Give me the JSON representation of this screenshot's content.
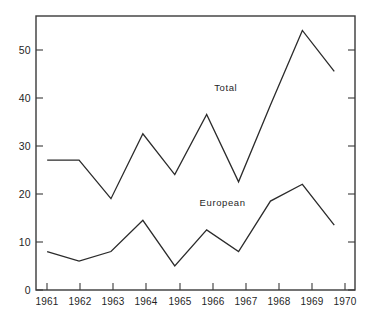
{
  "chart_data": {
    "type": "line",
    "title": "",
    "subtitle": "",
    "xlabel": "",
    "ylabel": "",
    "categories": [
      "1961",
      "1962",
      "1963",
      "1964",
      "1965",
      "1966",
      "1967",
      "1968",
      "1969",
      "1970"
    ],
    "x": [
      1961,
      1962,
      1963,
      1964,
      1965,
      1966,
      1967,
      1968,
      1969,
      1970
    ],
    "series": [
      {
        "name": "Total",
        "label": "Total",
        "values": [
          27,
          27,
          19,
          32.5,
          24,
          36.5,
          22.5,
          38.5,
          54,
          45.5
        ],
        "color": "#2b2b2b",
        "label_x": 1966.6,
        "label_y": 41.5
      },
      {
        "name": "European",
        "label": "European",
        "values": [
          8,
          6,
          8,
          14.5,
          5,
          12.5,
          8,
          18.5,
          22,
          13.5
        ],
        "color": "#2b2b2b",
        "label_x": 1966.5,
        "label_y": 17.5
      }
    ],
    "ylim": [
      0,
      57
    ],
    "xlim": [
      1960.65,
      1970.65
    ],
    "yticks": [
      0,
      10,
      20,
      30,
      40,
      50
    ],
    "ytick_labels": [
      "0",
      "10",
      "20",
      "30",
      "40",
      "50"
    ],
    "xtick_labels": [
      "1961",
      "1962",
      "1963",
      "1964",
      "1965",
      "1966",
      "1967",
      "1968",
      "1969",
      "1970"
    ],
    "grid": false,
    "legend": "inline-annotations",
    "frame": "box-with-inward-ticks",
    "axis_color": "#3a3a3a",
    "background_color": "#ffffff"
  }
}
